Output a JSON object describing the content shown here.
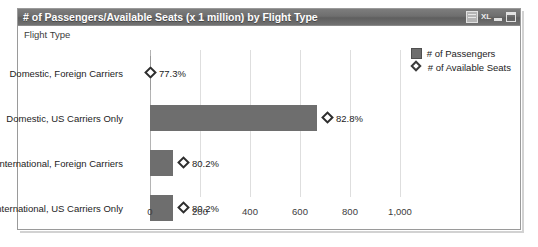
{
  "window": {
    "title": "# of Passengers/Available Seats (x 1 million) by Flight Type",
    "buttons": {
      "sheet": "worksheet-icon",
      "excel": "XL",
      "minimize": "minimize-icon",
      "maximize": "maximize-icon"
    }
  },
  "legend": {
    "items": [
      {
        "label": "# of Passengers",
        "glyph": "filled-square",
        "color": "#6e6e6e"
      },
      {
        "label": "# of Available Seats",
        "glyph": "hollow-diamond",
        "color": "#2e2e2e"
      }
    ]
  },
  "chart_data": {
    "type": "bar",
    "orientation": "horizontal",
    "title": "# of Passengers/Available Seats (x 1 million) by Flight Type",
    "xlabel": "",
    "ylabel": "Flight Type",
    "xlim": [
      0,
      1100
    ],
    "xticks": [
      0,
      200,
      400,
      600,
      800,
      1000
    ],
    "xticklabels": [
      "0",
      "200",
      "400",
      "600",
      "800",
      "1,000"
    ],
    "grid": true,
    "legend_position": "top-right",
    "categories": [
      "Domestic, Foreign Carriers",
      "Domestic, US Carriers Only",
      "International, Foreign Carriers",
      "International, US Carriers Only"
    ],
    "series": [
      {
        "name": "# of Passengers",
        "type": "bar",
        "values": [
          2,
          668,
          92,
          92
        ]
      },
      {
        "name": "# of Available Seats",
        "type": "marker",
        "marker": "hollow-diamond",
        "values": [
          3,
          806,
          115,
          115
        ],
        "labels": [
          "77.3%",
          "82.8%",
          "80.2%",
          "80.2%"
        ]
      }
    ]
  },
  "colors": {
    "bar": "#6e6e6e",
    "marker_outline": "#2e2e2e",
    "gridline": "#dedede",
    "titlebar": "#6e6e6e",
    "frame": "#9a9a9a"
  }
}
